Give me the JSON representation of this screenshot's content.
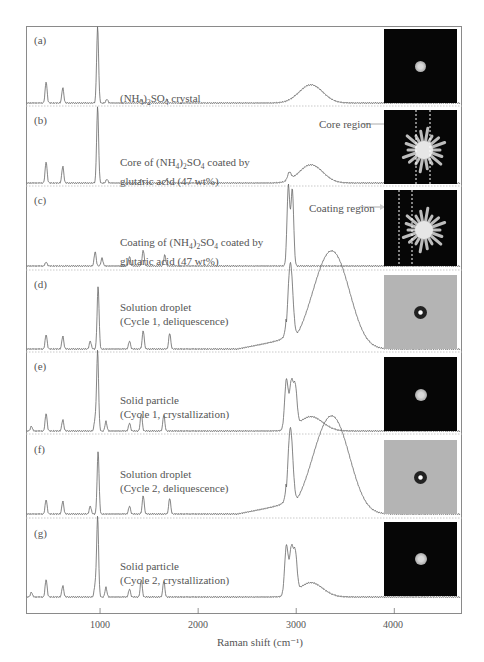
{
  "chart_data": {
    "type": "line",
    "title": "",
    "xlabel": "Raman shift (cm⁻¹)",
    "ylabel": "",
    "xlim": [
      245,
      4690
    ],
    "x_ticks": [
      1000,
      2000,
      3000,
      4000
    ],
    "x_tick_labels": [
      "1000",
      "2000",
      "3000",
      "4000"
    ],
    "grid": false,
    "legend": "none",
    "layout": "7 vertically stacked panels (a)-(g), each with inset particle image on right",
    "panels": [
      {
        "id": "a",
        "letter": "(a)",
        "label": "(NH4)2SO4 crystal",
        "image": "dark background, small bright round particle",
        "peaks_cm-1": [
          {
            "x": 450,
            "rel": 0.28
          },
          {
            "x": 620,
            "rel": 0.2
          },
          {
            "x": 975,
            "rel": 1.0
          },
          {
            "x": 1070,
            "rel": 0.05
          },
          {
            "x": 1420,
            "rel": 0.05
          },
          {
            "x": 1680,
            "rel": 0.05
          },
          {
            "x": 3150,
            "rel": 0.24
          }
        ]
      },
      {
        "id": "b",
        "letter": "(b)",
        "label": "Core of (NH4)2SO4 coated by glutaric acid (47 wt%)",
        "annotation": "Core region",
        "image": "dark background, bright starburst particle with two dotted vertical lines marking core region",
        "peaks_cm-1": [
          {
            "x": 450,
            "rel": 0.28
          },
          {
            "x": 620,
            "rel": 0.22
          },
          {
            "x": 975,
            "rel": 1.0
          },
          {
            "x": 1070,
            "rel": 0.05
          },
          {
            "x": 1420,
            "rel": 0.05
          },
          {
            "x": 1680,
            "rel": 0.05
          },
          {
            "x": 2930,
            "rel": 0.1
          },
          {
            "x": 3150,
            "rel": 0.24
          }
        ]
      },
      {
        "id": "c",
        "letter": "(c)",
        "label": "Coating of (NH4)2SO4 coated by glutaric acid (47 wt%)",
        "annotation": "Coating region",
        "image": "dark background, bright starburst particle with two dotted vertical lines marking coating region",
        "peaks_cm-1": [
          {
            "x": 450,
            "rel": 0.05
          },
          {
            "x": 950,
            "rel": 0.18
          },
          {
            "x": 1020,
            "rel": 0.1
          },
          {
            "x": 1300,
            "rel": 0.12
          },
          {
            "x": 1440,
            "rel": 0.2
          },
          {
            "x": 1660,
            "rel": 0.14
          },
          {
            "x": 2920,
            "rel": 1.0
          },
          {
            "x": 2960,
            "rel": 0.95
          }
        ]
      },
      {
        "id": "d",
        "letter": "(d)",
        "label": "Solution droplet (Cycle 1, deliquescence)",
        "image": "gray background, dark ring droplet with bright center",
        "peaks_cm-1": [
          {
            "x": 450,
            "rel": 0.18
          },
          {
            "x": 620,
            "rel": 0.16
          },
          {
            "x": 900,
            "rel": 0.1
          },
          {
            "x": 980,
            "rel": 0.78
          },
          {
            "x": 1300,
            "rel": 0.1
          },
          {
            "x": 1440,
            "rel": 0.23
          },
          {
            "x": 1710,
            "rel": 0.2
          },
          {
            "x": 2940,
            "rel": 1.0
          },
          {
            "x": 3250,
            "rel": 0.62
          },
          {
            "x": 3430,
            "rel": 0.84
          }
        ]
      },
      {
        "id": "e",
        "letter": "(e)",
        "label": "Solid particle (Cycle 1, crystallization)",
        "image": "dark background, small bright round particle",
        "peaks_cm-1": [
          {
            "x": 300,
            "rel": 0.06
          },
          {
            "x": 450,
            "rel": 0.22
          },
          {
            "x": 620,
            "rel": 0.14
          },
          {
            "x": 950,
            "rel": 0.15
          },
          {
            "x": 975,
            "rel": 1.0
          },
          {
            "x": 1060,
            "rel": 0.12
          },
          {
            "x": 1300,
            "rel": 0.1
          },
          {
            "x": 1420,
            "rel": 0.22
          },
          {
            "x": 1650,
            "rel": 0.2
          },
          {
            "x": 2900,
            "rel": 0.62
          },
          {
            "x": 2950,
            "rel": 0.55
          },
          {
            "x": 2990,
            "rel": 0.48
          },
          {
            "x": 3150,
            "rel": 0.18
          }
        ]
      },
      {
        "id": "f",
        "letter": "(f)",
        "label": "Solution droplet (Cycle 2, deliquescence)",
        "image": "gray background, dark ring droplet with bright center",
        "peaks_cm-1": [
          {
            "x": 450,
            "rel": 0.18
          },
          {
            "x": 620,
            "rel": 0.16
          },
          {
            "x": 900,
            "rel": 0.1
          },
          {
            "x": 980,
            "rel": 0.78
          },
          {
            "x": 1300,
            "rel": 0.1
          },
          {
            "x": 1440,
            "rel": 0.23
          },
          {
            "x": 1710,
            "rel": 0.2
          },
          {
            "x": 2940,
            "rel": 1.0
          },
          {
            "x": 3250,
            "rel": 0.62
          },
          {
            "x": 3430,
            "rel": 0.84
          }
        ]
      },
      {
        "id": "g",
        "letter": "(g)",
        "label": "Solid particle (Cycle 2, crystallization)",
        "image": "dark background, small bright round particle",
        "peaks_cm-1": [
          {
            "x": 300,
            "rel": 0.06
          },
          {
            "x": 450,
            "rel": 0.22
          },
          {
            "x": 620,
            "rel": 0.14
          },
          {
            "x": 950,
            "rel": 0.15
          },
          {
            "x": 975,
            "rel": 1.0
          },
          {
            "x": 1060,
            "rel": 0.12
          },
          {
            "x": 1300,
            "rel": 0.1
          },
          {
            "x": 1420,
            "rel": 0.22
          },
          {
            "x": 1650,
            "rel": 0.2
          },
          {
            "x": 2900,
            "rel": 0.62
          },
          {
            "x": 2950,
            "rel": 0.55
          },
          {
            "x": 2990,
            "rel": 0.48
          },
          {
            "x": 3150,
            "rel": 0.18
          }
        ]
      }
    ]
  },
  "labels": {
    "a": {
      "letter": "(a)",
      "pre": "(NH",
      "s1": "4",
      "mid": ")",
      "s2": "2",
      "post": "SO",
      "s3": "4",
      "end": " crystal"
    },
    "b": {
      "letter": "(b)",
      "pre": "Core of (NH",
      "s1": "4",
      "mid": ")",
      "s2": "2",
      "post": "SO",
      "s3": "4",
      "end": " coated by",
      "line2": "glutaric acid (47 wt%)",
      "region": "Core region"
    },
    "c": {
      "letter": "(c)",
      "pre": "Coating of (NH",
      "s1": "4",
      "mid": ")",
      "s2": "2",
      "post": "SO",
      "s3": "4",
      "end": " coated by",
      "line2": "glutaric acid (47 wt%)",
      "region": "Coating region"
    },
    "d": {
      "letter": "(d)",
      "line1": "Solution droplet",
      "line2": "(Cycle 1, deliquescence)"
    },
    "e": {
      "letter": "(e)",
      "line1": "Solid particle",
      "line2": "(Cycle 1, crystallization)"
    },
    "f": {
      "letter": "(f)",
      "line1": "Solution droplet",
      "line2": "(Cycle 2, deliquescence)"
    },
    "g": {
      "letter": "(g)",
      "line1": "Solid particle",
      "line2": "(Cycle 2, crystallization)"
    }
  },
  "axis": {
    "ticks": [
      "1000",
      "2000",
      "3000",
      "4000"
    ],
    "xlabel": "Raman shift (cm⁻¹)"
  }
}
